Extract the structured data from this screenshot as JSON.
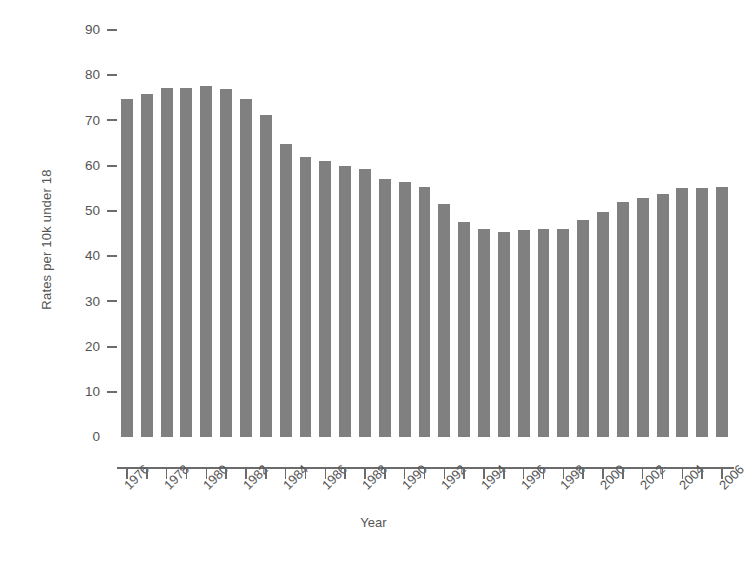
{
  "chart_data": {
    "type": "bar",
    "title": "",
    "xlabel": "Year",
    "ylabel": "Rates per 10k under 18",
    "categories": [
      "1976",
      "1977",
      "1978",
      "1979",
      "1980",
      "1981",
      "1982",
      "1983",
      "1984",
      "1985",
      "1986",
      "1987",
      "1988",
      "1989",
      "1990",
      "1991",
      "1992",
      "1993",
      "1994",
      "1995",
      "1996",
      "1997",
      "1998",
      "1999",
      "2000",
      "2001",
      "2002",
      "2003",
      "2004",
      "2005",
      "2006"
    ],
    "values": [
      74.8,
      75.8,
      77.1,
      77.2,
      77.7,
      77.0,
      74.8,
      71.2,
      64.8,
      62.0,
      61.0,
      60.0,
      59.2,
      57.0,
      56.3,
      55.3,
      51.5,
      47.5,
      46.0,
      45.4,
      45.8,
      46.0,
      45.9,
      47.9,
      49.8,
      51.9,
      52.9,
      53.8,
      55.0,
      55.0,
      55.2
    ],
    "xtick_labels": [
      "1976",
      "1978",
      "1980",
      "1982",
      "1984",
      "1986",
      "1988",
      "1990",
      "1992",
      "1994",
      "1996",
      "1998",
      "2000",
      "2002",
      "2004",
      "2006"
    ],
    "ytick_labels": [
      "90",
      "80",
      "70",
      "60",
      "50",
      "40",
      "30",
      "20",
      "10",
      "0"
    ],
    "ytick_values": [
      90,
      80,
      70,
      60,
      50,
      40,
      30,
      20,
      10,
      0
    ],
    "ylim": [
      0,
      90
    ],
    "grid": false,
    "legend": "none",
    "bar_color": "#808080",
    "axis_color": "#6b6b6b",
    "text_color": "#555555",
    "background_color": "#ffffff"
  }
}
